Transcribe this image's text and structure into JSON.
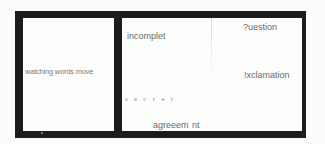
{
  "artwork": {
    "frame_color": "#1c1c1c",
    "panel_color": "#fdfdfc",
    "text_color": "#6e6e6e",
    "left_panel": {
      "text": "watching words move"
    },
    "right_panel": {
      "words": {
        "incomplete": "incomplet",
        "secret": "s e c r e t",
        "agreement": "agreeem nt",
        "question": "?uestion",
        "exclamation": "!xclamation"
      }
    }
  }
}
